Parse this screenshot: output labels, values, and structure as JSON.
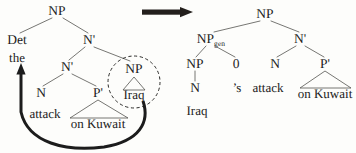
{
  "figure": {
    "type": "syntactic-tree-transformation",
    "ink_color": "#1c1c1c",
    "background_color": "#fdfdfb",
    "highlight_shape": "dashed-circle"
  },
  "transformation_arrow": {
    "name": "transformation-arrow",
    "direction": "right",
    "label": ""
  },
  "left_tree": {
    "name": "source-tree",
    "root": {
      "label": "NP"
    },
    "nodes": [
      {
        "id": "np-root",
        "label": "NP",
        "x": 57,
        "y": 11
      },
      {
        "id": "det",
        "label": "Det",
        "x": 17,
        "y": 40
      },
      {
        "id": "nbar-1",
        "label": "N'",
        "x": 89,
        "y": 40
      },
      {
        "id": "nbar-2",
        "label": "N'",
        "x": 67,
        "y": 67
      },
      {
        "id": "np-circled",
        "label": "NP",
        "x": 134,
        "y": 69
      },
      {
        "id": "n-leaf",
        "label": "N",
        "x": 41,
        "y": 93
      },
      {
        "id": "pbar",
        "label": "P'",
        "x": 98,
        "y": 93
      }
    ],
    "leaves": [
      {
        "id": "the",
        "label": "the",
        "x": 17,
        "y": 58
      },
      {
        "id": "iraq",
        "label": "Iraq",
        "x": 134,
        "y": 95
      },
      {
        "id": "attack",
        "label": "attack",
        "x": 45,
        "y": 114
      },
      {
        "id": "on-kuwait",
        "label": "on Kuwait",
        "x": 98,
        "y": 124
      }
    ],
    "movement_arrow": {
      "name": "movement-arrow",
      "from": "circled NP (Iraq)",
      "to": "Det / the",
      "style": "thick curved arrow with arrowhead pointing up"
    },
    "circled_constituent": "NP"
  },
  "right_tree": {
    "name": "result-tree",
    "nodes": [
      {
        "id": "np-root",
        "label": "NP",
        "x": 265,
        "y": 14
      },
      {
        "id": "np-gen",
        "label": "NP",
        "sub": "gen",
        "x": 210,
        "y": 39
      },
      {
        "id": "nbar",
        "label": "N'",
        "x": 300,
        "y": 39
      },
      {
        "id": "np-inner",
        "label": "NP",
        "x": 195,
        "y": 64
      },
      {
        "id": "zero",
        "label": "0",
        "x": 236,
        "y": 64
      },
      {
        "id": "n-head",
        "label": "N",
        "x": 275,
        "y": 64
      },
      {
        "id": "pbar",
        "label": "P'",
        "x": 325,
        "y": 64
      },
      {
        "id": "n-leaf",
        "label": "N",
        "x": 195,
        "y": 88
      }
    ],
    "leaves": [
      {
        "id": "iraq",
        "label": "Iraq",
        "x": 197,
        "y": 110
      },
      {
        "id": "poss",
        "label": "’s",
        "x": 237,
        "y": 88
      },
      {
        "id": "attack",
        "label": "attack",
        "x": 268,
        "y": 88
      },
      {
        "id": "on-kuwait",
        "label": "on Kuwait",
        "x": 325,
        "y": 94
      }
    ]
  }
}
